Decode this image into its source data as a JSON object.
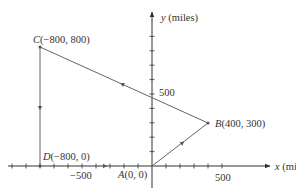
{
  "diagram": {
    "title": "",
    "axes": {
      "x_label_var": "x",
      "x_label_unit": " (miles)",
      "y_label_var": "y",
      "y_label_unit": " (miles)",
      "x_tick_label_neg": "−500",
      "x_tick_label_pos": "500",
      "y_tick_label": "500",
      "tick_interval": 100
    },
    "points": {
      "A": {
        "letter": "A",
        "coords": "(0, 0)",
        "x": 0,
        "y": 0
      },
      "B": {
        "letter": "B",
        "coords": "(400, 300)",
        "x": 400,
        "y": 300
      },
      "C": {
        "letter": "C",
        "coords": "(−800, 800)",
        "x": -800,
        "y": 800
      },
      "D": {
        "letter": "D",
        "coords": "(−800, 0)",
        "x": -800,
        "y": 0
      }
    },
    "path": [
      "A",
      "B",
      "C",
      "D",
      "A"
    ],
    "colors": {
      "axis": "#333333",
      "path": "#666666",
      "text": "#333333"
    }
  }
}
